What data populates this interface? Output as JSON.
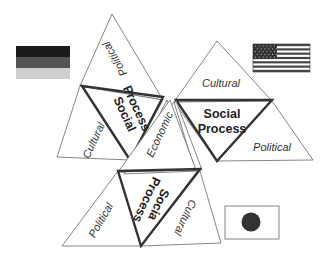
{
  "diagram": {
    "units": [
      {
        "country": "Germany",
        "flag": "german-flag",
        "center_label": [
          "Social",
          "Process"
        ],
        "face_labels": [
          "Political",
          "Cultural"
        ]
      },
      {
        "country": "United States",
        "flag": "us-flag",
        "center_label": [
          "Social",
          "Process"
        ],
        "face_labels": [
          "Cultural",
          "Political"
        ]
      },
      {
        "country": "Japan",
        "flag": "japan-flag",
        "center_label": [
          "Socia",
          "Process"
        ],
        "face_labels": [
          "Political",
          "Cultural"
        ]
      }
    ],
    "shared_face_label": "Economic"
  },
  "colors": {
    "outline": "#777777",
    "thick_outline": "#333333",
    "german_black": "#1a1a1a",
    "german_red": "#555555",
    "german_gold": "#cfcfcf",
    "us_stripe": "#444444",
    "japan_disc": "#333333"
  }
}
